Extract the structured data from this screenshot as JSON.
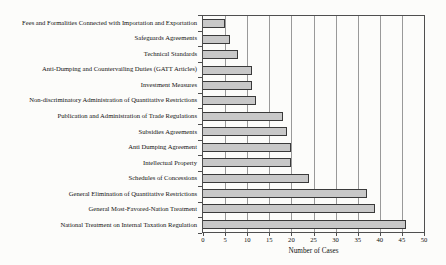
{
  "chart_data": {
    "type": "bar",
    "orientation": "horizontal",
    "title": "",
    "xlabel": "Number of Cases",
    "ylabel": "",
    "xlim": [
      0,
      50
    ],
    "xticks": [
      0,
      5,
      10,
      15,
      20,
      25,
      30,
      35,
      40,
      45,
      50
    ],
    "grid": "vertical gridlines at every x tick",
    "legend": "none",
    "categories": [
      "Fees and Formalities Connected with Importation and Exportation",
      "Safeguards Agreements",
      "Technical Standards",
      "Anti-Dumping and Countervailing Duties (GATT Articles)",
      "Investment Measures",
      "Non-discriminatory Administration of Quantitative Restrictions",
      "Publication and Administration of Trade Regulations",
      "Subsidies Agreements",
      "Anti Dumping Agreement",
      "Intellectual Property",
      "Schedules of Concessions",
      "General Elimination of Quantitative Restrictions",
      "General Most-Favored-Nation Treatment",
      "National Treatment on Internal Taxation Regulation"
    ],
    "values": [
      5,
      6,
      8,
      11,
      11,
      12,
      18,
      19,
      20,
      20,
      24,
      37,
      39,
      46
    ],
    "colors": {
      "bar_fill": "#c8c8c8",
      "bar_border": "#3a3a3a",
      "gridline": "#999999",
      "plot_border": "#4f4f4f",
      "text": "#111111",
      "background": "#fcfcfa"
    }
  }
}
